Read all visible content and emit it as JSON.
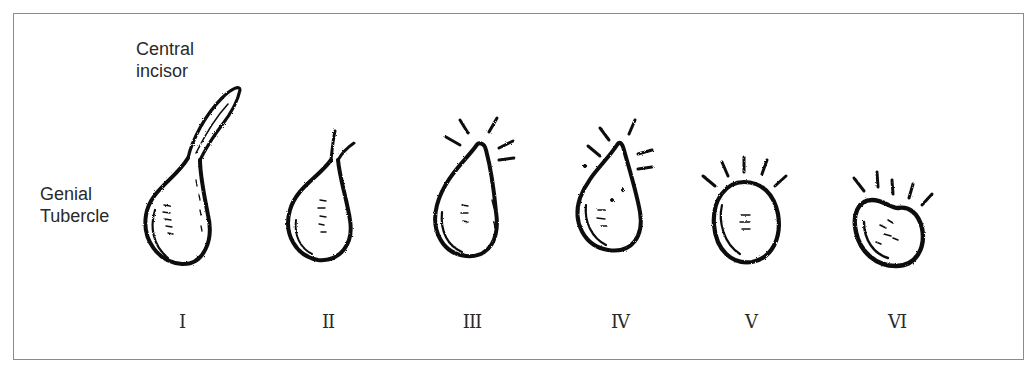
{
  "figure": {
    "labels": {
      "central_incisor_line1": "Central",
      "central_incisor_line2": "incisor",
      "genial_tubercle_line1": "Genial",
      "genial_tubercle_line2": "Tubercle"
    },
    "stages": [
      {
        "numeral": "I",
        "description": "Genial tubercle with erupting central incisor"
      },
      {
        "numeral": "II",
        "description": "Tubercle with small split tip"
      },
      {
        "numeral": "III",
        "description": "Tubercle tip with radiating lines (right side)"
      },
      {
        "numeral": "IV",
        "description": "Pear-shaped tubercle with radiating lines"
      },
      {
        "numeral": "V",
        "description": "Rounded tubercle with five radiating lines above"
      },
      {
        "numeral": "VI",
        "description": "Irregular rounded tubercle with five radiating lines above"
      }
    ],
    "colors": {
      "ink": "#111111",
      "frame": "#8a8a8a",
      "text": "#2a2a2a",
      "background": "#ffffff"
    }
  }
}
